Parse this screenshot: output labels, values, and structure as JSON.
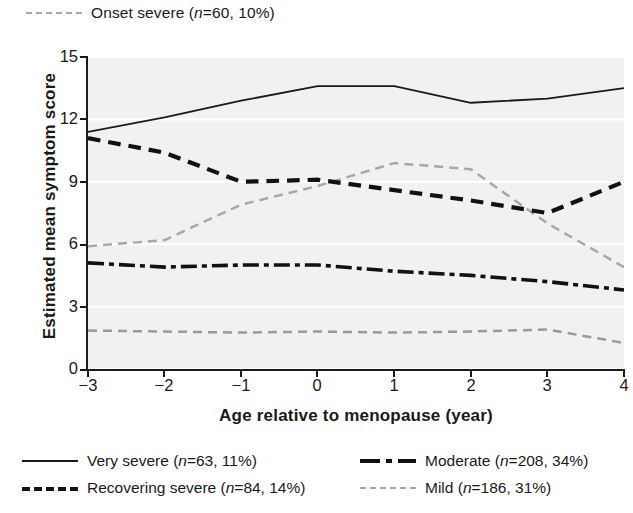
{
  "chart_data": {
    "type": "line",
    "title": "",
    "xlabel": "Age relative to menopause (year)",
    "ylabel": "Estimated mean symptom score",
    "x": [
      -3,
      -2,
      -1,
      0,
      1,
      2,
      3,
      4
    ],
    "xlim": [
      -3,
      4
    ],
    "ylim": [
      0,
      15
    ],
    "xticks": [
      "−3",
      "−2",
      "−1",
      "0",
      "1",
      "2",
      "3",
      "4"
    ],
    "yticks": [
      "0",
      "3",
      "6",
      "9",
      "12",
      "15"
    ],
    "grid": true,
    "legend_position": "bottom and top",
    "series": [
      {
        "name": "Onset severe",
        "label": "Onset severe (n=60, 10%)",
        "n": 60,
        "percent": "10%",
        "style": "dashed",
        "color": "#a8a8a8",
        "width": 2.5,
        "legend": "top",
        "values": [
          5.9,
          6.2,
          7.9,
          8.8,
          9.9,
          9.6,
          7.0,
          4.9
        ]
      },
      {
        "name": "Very severe",
        "label": "Very severe (n=63, 11%)",
        "n": 63,
        "percent": "11%",
        "style": "solid",
        "color": "#1a1a1a",
        "width": 1.8,
        "legend": "bottom-left-1",
        "values": [
          11.4,
          12.1,
          12.9,
          13.6,
          13.6,
          12.8,
          13.0,
          13.5
        ]
      },
      {
        "name": "Recovering severe",
        "label": "Recovering severe (n=84, 14%)",
        "n": 84,
        "percent": "14%",
        "style": "dashed",
        "color": "#111111",
        "width": 4.2,
        "legend": "bottom-left-2",
        "values": [
          11.1,
          10.4,
          9.0,
          9.1,
          8.6,
          8.1,
          7.5,
          9.0
        ]
      },
      {
        "name": "Moderate",
        "label": "Moderate (n=208, 34%)",
        "n": 208,
        "percent": "34%",
        "style": "dash-dot",
        "color": "#111111",
        "width": 3.6,
        "legend": "bottom-right-1",
        "values": [
          5.1,
          4.9,
          5.0,
          5.0,
          4.7,
          4.5,
          4.2,
          3.8
        ]
      },
      {
        "name": "Mild",
        "label": "Mild (n=186, 31%)",
        "n": 186,
        "percent": "31%",
        "style": "dashed",
        "color": "#9a9a9a",
        "width": 2.5,
        "legend": "bottom-right-2",
        "values": [
          1.85,
          1.8,
          1.75,
          1.8,
          1.75,
          1.8,
          1.9,
          1.25
        ]
      }
    ]
  },
  "top_legend": {
    "entry": "Onset severe (n=60, 10%)",
    "name_text": "Onset severe (",
    "n_italic": "n",
    "rest_text": "=60, 10%)"
  },
  "axes": {
    "y_title": "Estimated mean symptom score",
    "x_title": "Age relative to menopause (year)",
    "y_ticks": [
      "15",
      "12",
      "9",
      "6",
      "3",
      "0"
    ],
    "x_ticks": [
      "−3",
      "−2",
      "−1",
      "0",
      "1",
      "2",
      "3",
      "4"
    ]
  },
  "bottom_legend": {
    "items": [
      {
        "pre": "Very severe (",
        "ital": "n",
        "post": "=63, 11%)"
      },
      {
        "pre": "Moderate (",
        "ital": "n",
        "post": "=208, 34%)"
      },
      {
        "pre": "Recovering severe (",
        "ital": "n",
        "post": "=84, 14%)"
      },
      {
        "pre": "Mild (",
        "ital": "n",
        "post": "=186, 31%)"
      }
    ]
  },
  "colors": {
    "plot_background": "#f1f1f1",
    "gridline": "#ffffff",
    "axis": "#1a1a1a",
    "dark_series": "#111111",
    "light_series": "#a8a8a8"
  }
}
